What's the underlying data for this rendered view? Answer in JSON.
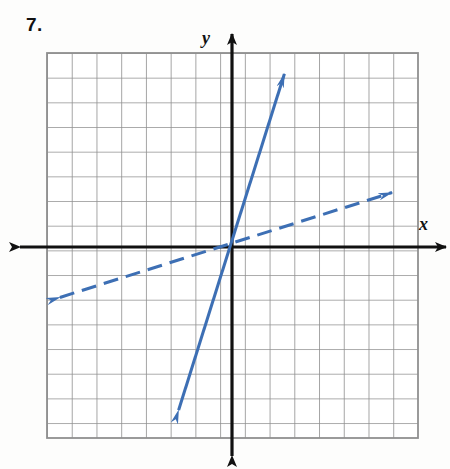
{
  "problem": {
    "number_label": "7."
  },
  "axes": {
    "x_label": "x",
    "y_label": "y",
    "axis_color": "#111111",
    "grid_color": "#8c8c8c"
  },
  "chart_data": {
    "type": "line",
    "title": "7.",
    "xlabel": "x",
    "ylabel": "y",
    "grid": true,
    "legend": null,
    "xlim": [
      -7.5,
      7.5
    ],
    "ylim": [
      -7.7,
      7.9
    ],
    "x_ticks": [
      -7,
      -6,
      -5,
      -4,
      -3,
      -2,
      -1,
      0,
      1,
      2,
      3,
      4,
      5,
      6,
      7
    ],
    "y_ticks": [
      -7,
      -6,
      -5,
      -4,
      -3,
      -2,
      -1,
      0,
      1,
      2,
      3,
      4,
      5,
      6,
      7
    ],
    "accent_color": "#3d6fb4",
    "series": [
      {
        "name": "steep-solid-line",
        "style": "solid",
        "color": "#3d6fb4",
        "arrows": "both",
        "slope": 3,
        "intercept": 0,
        "points": [
          [
            -2.2,
            -6.7
          ],
          [
            2.1,
            7.1
          ]
        ],
        "pixel_points": [
          [
            178,
            412
          ],
          [
            285,
            72
          ]
        ]
      },
      {
        "name": "shallow-dashed-line",
        "style": "dashed",
        "color": "#3d6fb4",
        "arrows": "both",
        "slope": 0.33,
        "intercept": 0,
        "points": [
          [
            -7.05,
            -2.05
          ],
          [
            6.55,
            2.25
          ]
        ],
        "pixel_points": [
          [
            58,
            298
          ],
          [
            394,
            192
          ]
        ]
      }
    ]
  },
  "geometry": {
    "grid_left": 47,
    "grid_top": 53,
    "grid_right": 418,
    "grid_bottom": 438,
    "cell_size": 24.7,
    "origin_x": 232,
    "origin_y": 247
  }
}
